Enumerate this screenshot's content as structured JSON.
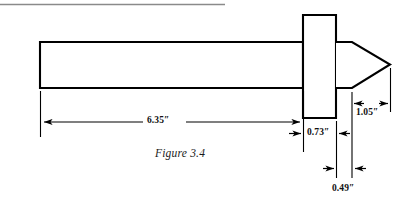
{
  "figure": {
    "caption": "Figure 3.4",
    "part_name": "tapered-shaft-with-collar",
    "units": "inches",
    "line_color": "#000000",
    "rule_color": "#8a8a8a",
    "background": "#ffffff"
  },
  "dimensions": [
    {
      "id": "overall-shaft-length",
      "label": "6.35″",
      "value": 6.35,
      "unit": "in",
      "arrow_style": "inward",
      "orientation": "horizontal"
    },
    {
      "id": "collar-width",
      "label": "0.73″",
      "value": 0.73,
      "unit": "in",
      "arrow_style": "outward",
      "orientation": "horizontal"
    },
    {
      "id": "cone-tip-length",
      "label": "1.05″",
      "value": 1.05,
      "unit": "in",
      "arrow_style": "inward",
      "orientation": "horizontal"
    },
    {
      "id": "cone-flat-length",
      "label": "0.49″",
      "value": 0.49,
      "unit": "in",
      "arrow_style": "outward",
      "orientation": "horizontal"
    }
  ],
  "geometry": {
    "top_rule": {
      "x1": 0,
      "y1": 4,
      "x2": 225,
      "y2": 4
    },
    "shaft": {
      "x": 40,
      "y": 42,
      "width": 263,
      "height": 46
    },
    "collar": {
      "x": 303,
      "y": 15,
      "width": 33,
      "height": 103
    },
    "cone": {
      "start_x": 337,
      "flat_end_x": 352,
      "tip_x": 390,
      "top_y": 42,
      "bottom_y": 88,
      "tip_y": 65
    }
  }
}
